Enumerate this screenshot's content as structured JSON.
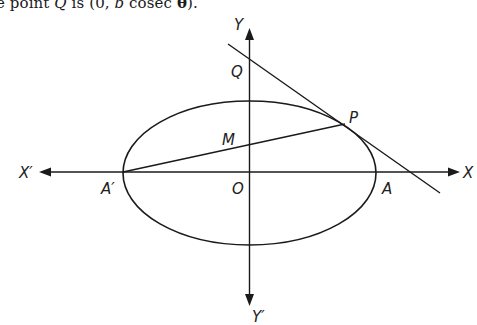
{
  "caption": {
    "prefix": "e point ",
    "point": "Q",
    "middle": " is (0, ",
    "var_b": "b",
    "func": " cosec ",
    "theta": "θ",
    "suffix": ")."
  },
  "figure": {
    "stroke_color": "#1a1a1a",
    "labels": {
      "Y": "Y",
      "Y_prime": "Y′",
      "X": "X",
      "X_prime": "X′",
      "Q": "Q",
      "P": "P",
      "M": "M",
      "O": "O",
      "A": "A",
      "A_prime": "A′"
    }
  }
}
